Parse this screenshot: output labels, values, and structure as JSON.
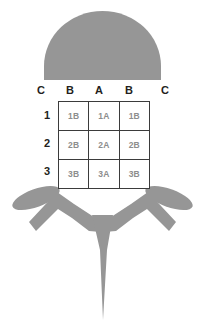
{
  "figure": {
    "kind": "bacteriophage-schematic",
    "body_color": "#969696",
    "grid_border_color": "#3b3b3b",
    "cell_text_color": "#8d8d8d",
    "label_text_color": "#231f20",
    "background": "#ffffff"
  },
  "column_headers": {
    "outer_left": "C",
    "inner_left": "B",
    "center": "A",
    "inner_right": "B",
    "outer_right": "C"
  },
  "row_headers": [
    "1",
    "2",
    "3"
  ],
  "grid": {
    "rows": [
      [
        "1B",
        "1A",
        "1B"
      ],
      [
        "2B",
        "2A",
        "2B"
      ],
      [
        "3B",
        "3A",
        "3B"
      ]
    ]
  },
  "parts": {
    "head": "phage-head-dome",
    "left_leg": "phage-left-leg",
    "right_leg": "phage-right-leg",
    "left_fin": "phage-left-fin-ellipse",
    "right_fin": "phage-right-fin-ellipse",
    "tail": "phage-tail-spike"
  }
}
